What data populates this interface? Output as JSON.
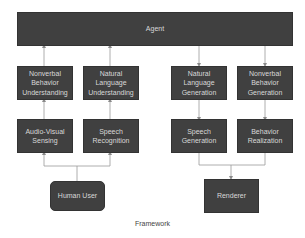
{
  "diagram": {
    "caption": "Framework",
    "colors": {
      "box_fill": "#404040",
      "box_text": "#d8d8d8",
      "line": "#9a9a9a",
      "background": "#ffffff"
    },
    "nodes": {
      "agent": {
        "label": "Agent"
      },
      "nonverbal_understanding": {
        "label": "Nonverbal Behavior Understanding"
      },
      "nl_understanding": {
        "label": "Natural Language Understanding"
      },
      "nl_generation": {
        "label": "Natural Language Generation"
      },
      "nonverbal_generation": {
        "label": "Nonverbal Behavior Generation"
      },
      "av_sensing": {
        "label": "Audio-Visual Sensing"
      },
      "speech_recognition": {
        "label": "Speech Recognition"
      },
      "speech_generation": {
        "label": "Speech Generation"
      },
      "behavior_realization": {
        "label": "Behavior Realization"
      },
      "human_user": {
        "label": "Human User"
      },
      "renderer": {
        "label": "Renderer"
      }
    },
    "edges": [
      {
        "from": "human_user",
        "to": "av_sensing"
      },
      {
        "from": "human_user",
        "to": "speech_recognition"
      },
      {
        "from": "av_sensing",
        "to": "nonverbal_understanding"
      },
      {
        "from": "speech_recognition",
        "to": "nl_understanding"
      },
      {
        "from": "nonverbal_understanding",
        "to": "agent"
      },
      {
        "from": "nl_understanding",
        "to": "agent"
      },
      {
        "from": "agent",
        "to": "nl_generation"
      },
      {
        "from": "agent",
        "to": "nonverbal_generation"
      },
      {
        "from": "nl_generation",
        "to": "speech_generation"
      },
      {
        "from": "nonverbal_generation",
        "to": "behavior_realization"
      },
      {
        "from": "speech_generation",
        "to": "renderer"
      },
      {
        "from": "behavior_realization",
        "to": "renderer"
      }
    ]
  }
}
